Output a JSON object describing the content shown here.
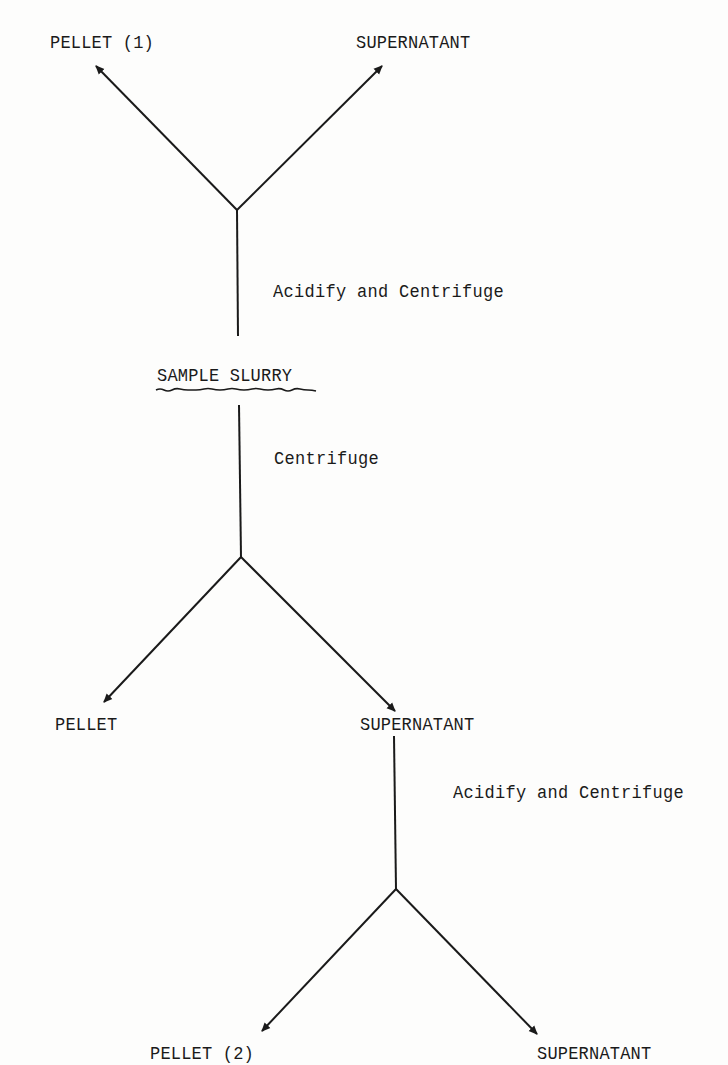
{
  "diagram": {
    "type": "flowchart",
    "root": {
      "id": "sample-slurry",
      "label": "SAMPLE SLURRY",
      "emphasis": "wavy-underline"
    },
    "nodes": {
      "pellet_1": "PELLET (1)",
      "supernatant_top": "SUPERNATANT",
      "sample_slurry": "SAMPLE SLURRY",
      "pellet_mid": "PELLET",
      "supernatant_mid": "SUPERNATANT",
      "pellet_2": "PELLET (2)",
      "supernatant_bottom": "SUPERNATANT"
    },
    "steps": {
      "top": "Acidify and Centrifuge",
      "middle": "Centrifuge",
      "bottom": "Acidify and Centrifuge"
    },
    "edges": [
      {
        "from": "SAMPLE SLURRY",
        "via": "Acidify and Centrifuge",
        "to": [
          "PELLET (1)",
          "SUPERNATANT"
        ]
      },
      {
        "from": "SAMPLE SLURRY",
        "via": "Centrifuge",
        "to": [
          "PELLET",
          "SUPERNATANT"
        ]
      },
      {
        "from": "SUPERNATANT",
        "via": "Acidify and Centrifuge",
        "to": [
          "PELLET (2)",
          "SUPERNATANT"
        ]
      }
    ],
    "colors": {
      "ink": "#1a1a1a",
      "paper": "#fdfdfc"
    }
  }
}
